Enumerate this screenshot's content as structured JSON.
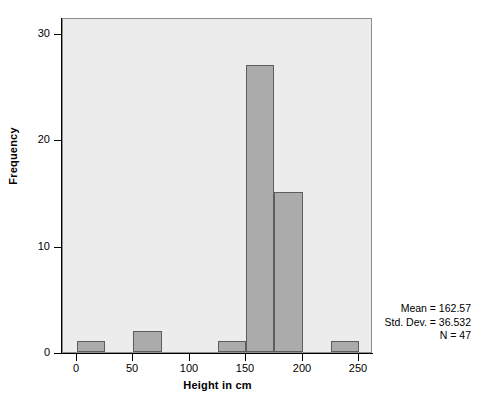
{
  "chart_data": {
    "type": "bar",
    "title": "",
    "subtitle": "",
    "xlabel": "Height in cm",
    "ylabel": "Frequency",
    "xlim": [
      -12.5,
      262.5
    ],
    "ylim": [
      0,
      31.5
    ],
    "grid": false,
    "legend": null,
    "bin_width": 25,
    "categories": [
      "0-25",
      "25-50",
      "50-75",
      "75-100",
      "100-125",
      "125-150",
      "150-175",
      "175-200",
      "200-225",
      "225-250"
    ],
    "bin_starts": [
      0,
      25,
      50,
      75,
      100,
      125,
      150,
      175,
      200,
      225
    ],
    "bin_ends": [
      25,
      50,
      75,
      100,
      125,
      150,
      175,
      200,
      225,
      250
    ],
    "values": [
      1,
      0,
      2,
      0,
      0,
      1,
      27,
      15,
      0,
      1
    ],
    "bars": [
      {
        "label": "0-25",
        "start": 0,
        "end": 25,
        "value": 1
      },
      {
        "label": "50-75",
        "start": 50,
        "end": 75,
        "value": 2
      },
      {
        "label": "125-150",
        "start": 125,
        "end": 150,
        "value": 1
      },
      {
        "label": "150-175",
        "start": 150,
        "end": 175,
        "value": 27
      },
      {
        "label": "175-200",
        "start": 175,
        "end": 200,
        "value": 15
      },
      {
        "label": "225-250",
        "start": 225,
        "end": 250,
        "value": 1
      }
    ],
    "x_ticks": [
      0,
      50,
      100,
      150,
      200,
      250
    ],
    "x_tick_labels": [
      "0",
      "50",
      "100",
      "150",
      "200",
      "250"
    ],
    "y_ticks": [
      0,
      10,
      20,
      30
    ],
    "y_tick_labels": [
      "0",
      "10",
      "20",
      "30"
    ],
    "annotations": [
      "Mean = 162.57",
      "Std. Dev. = 36.532",
      "N = 47"
    ],
    "colors": {
      "bar_fill": "#ababab",
      "bar_edge": "#5d5d5d",
      "plot_background": "#ececec",
      "plot_border": "#8e8e8e",
      "axis": "#000000",
      "text": "#000000",
      "page_background": "#ffffff"
    }
  },
  "stats": {
    "mean_label": "Mean = 162.57",
    "stddev_label": "Std. Dev. = 36.532",
    "n_label": "N = 47"
  },
  "axes": {
    "x_title": "Height in cm",
    "y_title": "Frequency"
  }
}
